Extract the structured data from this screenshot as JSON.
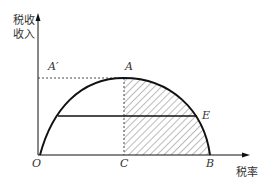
{
  "diagram": {
    "type": "laffer-curve",
    "y_axis_label_line1": "税收",
    "y_axis_label_line2": "收入",
    "x_axis_label": "税率",
    "points": {
      "A_prime": "A′",
      "A": "A",
      "E": "E",
      "O": "O",
      "C": "C",
      "B": "B"
    },
    "colors": {
      "line": "#111111",
      "hatch": "#555555",
      "dashed": "#333333"
    }
  }
}
